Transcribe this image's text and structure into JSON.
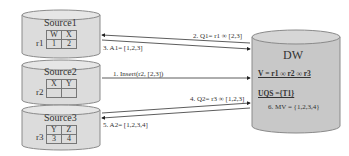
{
  "sources": [
    {
      "title": "Source1",
      "relation": "r1",
      "headers": [
        "W",
        "X"
      ],
      "values": [
        "1",
        "2"
      ]
    },
    {
      "title": "Source2",
      "relation": "r2",
      "headers": [
        "X",
        "Y"
      ],
      "values": [
        "",
        ""
      ]
    },
    {
      "title": "Source3",
      "relation": "r3",
      "headers": [
        "Y",
        "Z"
      ],
      "values": [
        "3",
        "4"
      ]
    }
  ],
  "dw": {
    "title": "DW",
    "view": "V = r1 ∞ r2 ∞ r3",
    "uqs": "UQS ={T1}",
    "mv": "6. MV = {1,2,3,4}"
  },
  "messages": {
    "q1": "2. Q1= r1 ∞ [2,3]",
    "a1": "3. A1= [1,2,3]",
    "insert": "1. Insert(r2, [2,3])",
    "q2": "4. Q2= r3 ∞ [1,2,3]",
    "a2": "5. A2= [1,2,3,4]"
  },
  "colors": {
    "cylinder_fill": "#d9d9d9",
    "cylinder_stroke": "#8a8a8a",
    "dw_fill": "#c4c4c4",
    "arrow": "#333333"
  }
}
